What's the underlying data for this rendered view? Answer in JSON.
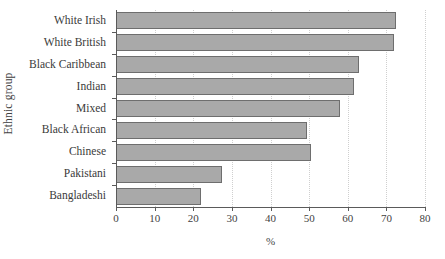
{
  "chart_data": {
    "type": "bar",
    "orientation": "horizontal",
    "title": "",
    "xlabel": "%",
    "ylabel": "Ethnic group",
    "xlim": [
      0,
      80
    ],
    "ylim": null,
    "xticks": [
      0,
      10,
      20,
      30,
      40,
      50,
      60,
      70,
      80
    ],
    "grid": "vertical-dotted",
    "legend": "none",
    "categories": [
      "White Irish",
      "White British",
      "Black Caribbean",
      "Indian",
      "Mixed",
      "Black African",
      "Chinese",
      "Pakistani",
      "Bangladeshi"
    ],
    "values": [
      72.5,
      72.0,
      63.0,
      61.5,
      58.0,
      49.5,
      50.5,
      27.5,
      22.0
    ],
    "bar_fill_color": "#a9a9a9",
    "bar_edge_color": "#6e6e6e",
    "axis_color": "#5a5a5a",
    "grid_color": "#cfcfcf",
    "background_color": "#ffffff"
  }
}
